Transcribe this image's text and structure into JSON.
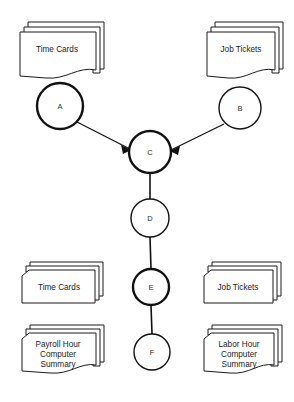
{
  "diagram": {
    "background_color": "#ffffff",
    "line_color": "#111111",
    "shape_fill": "#ffffff",
    "documents": [
      {
        "id": "doc-time-cards-top",
        "label": "Time Cards",
        "shape": "document-stack",
        "position": "top-left"
      },
      {
        "id": "doc-job-tickets-top",
        "label": "Job Tickets",
        "shape": "document-stack",
        "position": "top-right"
      },
      {
        "id": "doc-time-cards-bottom",
        "label": "Time Cards",
        "shape": "card-stack",
        "position": "bottom-left-upper"
      },
      {
        "id": "doc-job-tickets-bottom",
        "label": "Job Tickets",
        "shape": "card-stack",
        "position": "bottom-right-upper"
      },
      {
        "id": "doc-payroll-summary",
        "label_lines": [
          "Payroll Hour",
          "Computer",
          "Summary"
        ],
        "shape": "document-stack",
        "position": "bottom-left-lower"
      },
      {
        "id": "doc-labor-summary",
        "label_lines": [
          "Labor Hour",
          "Computer",
          "Summary"
        ],
        "shape": "document-stack",
        "position": "bottom-right-lower"
      }
    ],
    "nodes": [
      {
        "id": "node-a",
        "label": "A",
        "cx": 60,
        "cy": 106,
        "r": 23,
        "weight": "thick"
      },
      {
        "id": "node-b",
        "label": "B",
        "cx": 240,
        "cy": 108,
        "r": 21,
        "weight": "thin"
      },
      {
        "id": "node-c",
        "label": "C",
        "cx": 150,
        "cy": 152,
        "r": 21,
        "weight": "thick"
      },
      {
        "id": "node-d",
        "label": "D",
        "cx": 150,
        "cy": 218,
        "r": 19,
        "weight": "thin"
      },
      {
        "id": "node-e",
        "label": "E",
        "cx": 151,
        "cy": 287,
        "r": 18,
        "weight": "thick"
      },
      {
        "id": "node-f",
        "label": "F",
        "cx": 152,
        "cy": 352,
        "r": 18,
        "weight": "thin"
      }
    ],
    "connections": [
      {
        "id": "edge-a-c",
        "from": "A",
        "to": "C",
        "type": "arrow"
      },
      {
        "id": "edge-b-c",
        "from": "B",
        "to": "C",
        "type": "arrow"
      },
      {
        "id": "edge-c-d",
        "from": "C",
        "to": "D",
        "type": "line"
      },
      {
        "id": "edge-d-e",
        "from": "D",
        "to": "E",
        "type": "line"
      },
      {
        "id": "edge-e-f",
        "from": "E",
        "to": "F",
        "type": "line"
      }
    ]
  }
}
